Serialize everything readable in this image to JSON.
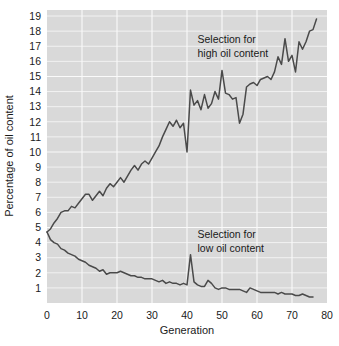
{
  "chart_data": {
    "type": "line",
    "title": "",
    "xlabel": "Generation",
    "ylabel": "Percentage of oil content",
    "xlim": [
      0,
      80
    ],
    "ylim": [
      0,
      19.4
    ],
    "grid": true,
    "legend": "none",
    "x_ticks": [
      0,
      10,
      20,
      30,
      40,
      50,
      60,
      70,
      80
    ],
    "x_tick_labels": [
      "0",
      "10",
      "20",
      "30",
      "40",
      "50",
      "60",
      "70",
      "80"
    ],
    "y_ticks": [
      1,
      2,
      3,
      4,
      5,
      6,
      7,
      8,
      9,
      10,
      11,
      12,
      13,
      14,
      15,
      16,
      17,
      18,
      19
    ],
    "y_tick_labels": [
      "1",
      "2",
      "3",
      "4",
      "5",
      "6",
      "7",
      "8",
      "9",
      "10",
      "11",
      "12",
      "13",
      "14",
      "15",
      "16",
      "17",
      "18",
      "19"
    ],
    "annotations": [
      {
        "id": "high-annotation",
        "line1": "Selection for",
        "line2": "high oil content",
        "x": 43,
        "y": 17.2
      },
      {
        "id": "low-annotation",
        "line1": "Selection for",
        "line2": "low oil content",
        "x": 43,
        "y": 4.3
      }
    ],
    "line_color": "#4a4a4a",
    "plot_background": "#d9d9d9",
    "gridline_color": "#f2f2f2",
    "series": [
      {
        "name": "Selection for high oil content",
        "x": [
          0,
          1,
          2,
          3,
          4,
          5,
          6,
          7,
          8,
          9,
          10,
          11,
          12,
          13,
          14,
          15,
          16,
          17,
          18,
          19,
          20,
          21,
          22,
          23,
          24,
          25,
          26,
          27,
          28,
          29,
          30,
          31,
          32,
          33,
          34,
          35,
          36,
          37,
          38,
          39,
          40,
          41,
          42,
          43,
          44,
          45,
          46,
          47,
          48,
          49,
          50,
          51,
          52,
          53,
          54,
          55,
          56,
          57,
          58,
          59,
          60,
          61,
          62,
          63,
          64,
          65,
          66,
          67,
          68,
          69,
          70,
          71,
          72,
          73,
          74,
          75,
          76,
          77
        ],
        "values": [
          4.7,
          4.9,
          5.3,
          5.6,
          6.0,
          6.1,
          6.1,
          6.4,
          6.3,
          6.6,
          6.9,
          7.2,
          7.2,
          6.8,
          7.1,
          7.4,
          7.1,
          7.6,
          7.9,
          7.7,
          8.0,
          8.3,
          8.0,
          8.4,
          8.8,
          9.1,
          8.8,
          9.2,
          9.4,
          9.2,
          9.6,
          10.0,
          10.4,
          11.0,
          11.5,
          12.0,
          11.7,
          12.1,
          11.6,
          11.9,
          10.0,
          14.1,
          13.1,
          13.4,
          12.8,
          13.8,
          12.9,
          13.2,
          14.0,
          13.5,
          15.4,
          13.9,
          13.8,
          13.5,
          13.6,
          11.9,
          12.5,
          14.3,
          14.5,
          14.6,
          14.4,
          14.8,
          14.9,
          15.0,
          14.8,
          15.3,
          16.3,
          15.8,
          17.5,
          16.0,
          16.4,
          15.3,
          17.3,
          16.8,
          17.3,
          18.0,
          18.1,
          18.8
        ]
      },
      {
        "name": "Selection for low oil content",
        "x": [
          0,
          1,
          2,
          3,
          4,
          5,
          6,
          7,
          8,
          9,
          10,
          11,
          12,
          13,
          14,
          15,
          16,
          17,
          18,
          19,
          20,
          21,
          22,
          23,
          24,
          25,
          26,
          27,
          28,
          29,
          30,
          31,
          32,
          33,
          34,
          35,
          36,
          37,
          38,
          39,
          40,
          41,
          42,
          43,
          44,
          45,
          46,
          47,
          48,
          49,
          50,
          51,
          52,
          53,
          54,
          55,
          56,
          57,
          58,
          59,
          60,
          61,
          62,
          63,
          64,
          65,
          66,
          67,
          68,
          69,
          70,
          71,
          72,
          73,
          74,
          75,
          76
        ],
        "values": [
          4.7,
          4.2,
          4.0,
          3.9,
          3.6,
          3.5,
          3.3,
          3.2,
          3.1,
          2.9,
          2.8,
          2.7,
          2.5,
          2.4,
          2.3,
          2.1,
          2.2,
          1.9,
          2.0,
          2.0,
          2.0,
          2.1,
          2.0,
          1.9,
          1.8,
          1.8,
          1.7,
          1.7,
          1.6,
          1.6,
          1.6,
          1.5,
          1.4,
          1.5,
          1.3,
          1.4,
          1.3,
          1.3,
          1.2,
          1.3,
          1.2,
          3.2,
          1.4,
          1.2,
          1.1,
          1.1,
          1.5,
          1.3,
          1.0,
          0.9,
          1.0,
          1.0,
          0.9,
          0.9,
          0.9,
          0.9,
          0.8,
          0.7,
          1.0,
          0.9,
          0.8,
          0.7,
          0.7,
          0.7,
          0.7,
          0.7,
          0.6,
          0.7,
          0.6,
          0.6,
          0.6,
          0.5,
          0.5,
          0.6,
          0.5,
          0.4,
          0.4
        ]
      }
    ]
  }
}
